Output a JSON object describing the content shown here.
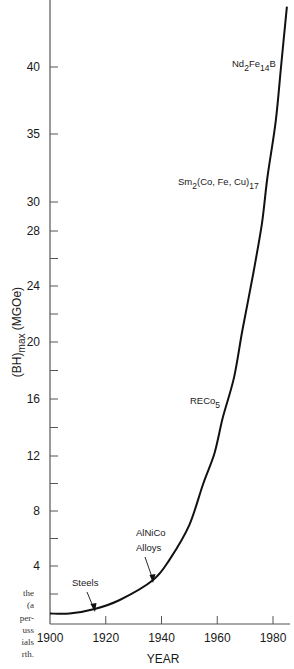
{
  "chart_data": {
    "type": "line",
    "title": "",
    "xlabel": "YEAR",
    "ylabel": "(BH)max (MGOe)",
    "ylabel_parts": {
      "main": "(BH)",
      "sub": "max",
      "unit": " (MGOe)"
    },
    "xlim": [
      1900,
      1985
    ],
    "ylim": [
      0,
      45
    ],
    "x_ticks": [
      1900,
      1920,
      1940,
      1960,
      1980
    ],
    "x_tick_labels": [
      "1900",
      "1920",
      "1940",
      "1960",
      "1980"
    ],
    "y_ticks_labeled": [
      4,
      8,
      12,
      16,
      20,
      24,
      28,
      30,
      35,
      40
    ],
    "y_tick_labels": [
      "4",
      "8",
      "12",
      "16",
      "20",
      "24",
      "28",
      "30",
      "35",
      "40"
    ],
    "y_ticks_minor": [
      2,
      6,
      10,
      14,
      18,
      22,
      26
    ],
    "grid": false,
    "legend": null,
    "series": [
      {
        "name": "Max energy product of permanent magnets",
        "x": [
          1900,
          1907,
          1916,
          1925,
          1937,
          1943,
          1950,
          1955,
          1959,
          1962,
          1966,
          1969,
          1973,
          1976,
          1978,
          1981,
          1983,
          1985
        ],
        "y": [
          0.7,
          0.7,
          1.0,
          1.6,
          3.0,
          4.5,
          7.0,
          10.0,
          12.2,
          14.7,
          17.5,
          20.8,
          25.0,
          28.5,
          31.8,
          36.0,
          40.3,
          44.5
        ]
      }
    ],
    "annotations": [
      {
        "text": "Steels",
        "x": 1916,
        "y": 1.0,
        "arrow": true
      },
      {
        "text": "AlNiCo Alloys",
        "x": 1937,
        "y": 3.0,
        "arrow": true
      },
      {
        "text": "RECo5",
        "main": "RECo",
        "sub": "5",
        "x": 1966,
        "y": 16
      },
      {
        "text": "Sm2(Co, Fe, Cu)17",
        "x": 1978,
        "y": 31
      },
      {
        "text": "Nd2Fe14B",
        "x": 1983,
        "y": 40
      }
    ]
  },
  "labels": {
    "xlabel": "YEAR",
    "ylabel_main": "(BH)",
    "ylabel_sub": "max",
    "ylabel_unit": " (MGOe)",
    "steels": "Steels",
    "alnico_1": "AlNiCo",
    "alnico_2": "Alloys",
    "reco_main": "RECo",
    "reco_sub": "5",
    "sm_1": "Sm",
    "sm_2": "2",
    "sm_3": "(Co, Fe, Cu)",
    "sm_4": "17",
    "nd_1": "Nd",
    "nd_2": "2",
    "nd_3": "Fe",
    "nd_4": "14",
    "nd_5": "B"
  },
  "caption_fragment": [
    "the",
    "(a",
    "per-",
    "uss",
    "ials",
    "rth."
  ]
}
